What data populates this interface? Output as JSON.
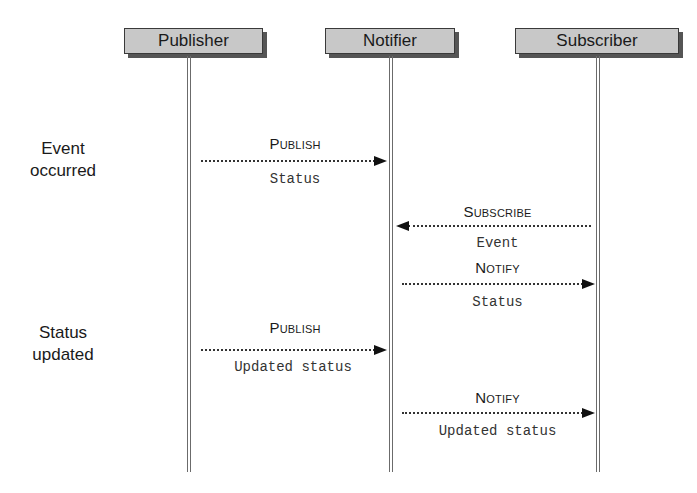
{
  "diagram": {
    "type": "sequence",
    "actors": [
      {
        "id": "publisher",
        "label": "Publisher"
      },
      {
        "id": "notifier",
        "label": "Notifier"
      },
      {
        "id": "subscriber",
        "label": "Subscriber"
      }
    ],
    "events": [
      {
        "label_line1": "Event",
        "label_line2": "occurred"
      },
      {
        "label_line1": "Status",
        "label_line2": "updated"
      }
    ],
    "messages": [
      {
        "name": "Publish",
        "param": "Status",
        "from": "Publisher",
        "to": "Notifier"
      },
      {
        "name": "Subscribe",
        "param": "Event",
        "from": "Subscriber",
        "to": "Notifier"
      },
      {
        "name": "Notify",
        "param": "Status",
        "from": "Notifier",
        "to": "Subscriber"
      },
      {
        "name": "Publish",
        "param": "Updated status",
        "from": "Publisher",
        "to": "Notifier"
      },
      {
        "name": "Notify",
        "param": "Updated status",
        "from": "Notifier",
        "to": "Subscriber"
      }
    ]
  }
}
